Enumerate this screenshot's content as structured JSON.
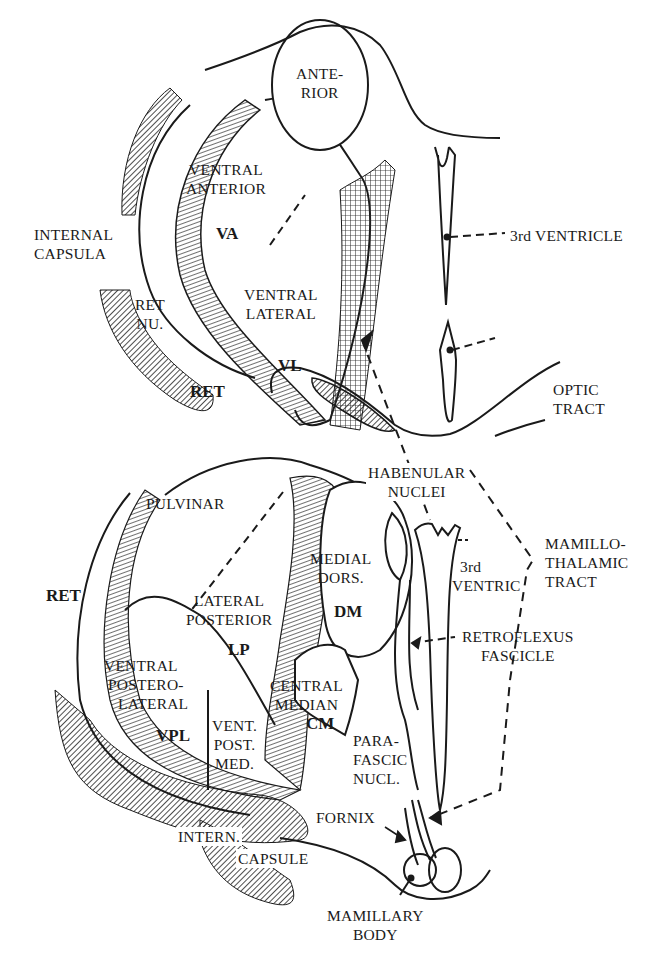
{
  "figure": {
    "upper_section": {
      "labels": {
        "anterior": [
          "ANTE-",
          "RIOR"
        ],
        "ventral_anterior": [
          "VENTRAL",
          "ANTERIOR"
        ],
        "va": "VA",
        "internal_capsula": [
          "INTERNAL",
          "CAPSULA"
        ],
        "ret_nu": [
          "RET",
          "NU."
        ],
        "ret": "RET",
        "ventral_lateral": [
          "VENTRAL",
          "LATERAL"
        ],
        "vl": "VL",
        "third_ventricle": "3rd VENTRICLE"
      }
    },
    "middle_section": {
      "labels": {
        "optic_tract": [
          "OPTIC",
          "TRACT"
        ]
      }
    },
    "lower_section": {
      "labels": {
        "pulvinar": "PULVINAR",
        "ret": "RET",
        "lateral_posterior": [
          "LATERAL",
          "POSTERIOR"
        ],
        "lp": "LP",
        "medial_dors": [
          "MEDIAL",
          "DORS."
        ],
        "dm": "DM",
        "habenular_nuclei": [
          "HABENULAR",
          "NUCLEI"
        ],
        "third_ventric": [
          "3rd",
          "VENTRIC"
        ],
        "mamillothalamic_tract": [
          "MAMILLO-",
          "THALAMIC",
          "TRACT"
        ],
        "retroflexus_fascicle": [
          "RETROFLEXUS",
          "FASCICLE"
        ],
        "ventral_posterolateral": [
          "VENTRAL",
          "POSTERO-",
          "LATERAL"
        ],
        "vpl": "VPL",
        "vent_post_med": [
          "VENT.",
          "POST.",
          "MED."
        ],
        "central_median": [
          "CENTRAL",
          "MEDIAN"
        ],
        "cm": "CM",
        "parafascic_nucl": [
          "PARA-",
          "FASCIC",
          "NUCL."
        ],
        "fornix": "FORNIX",
        "intern_capsule": [
          "INTERN.",
          "CAPSULE"
        ],
        "mamillary_body": [
          "MAMILLARY",
          "BODY"
        ]
      }
    }
  }
}
